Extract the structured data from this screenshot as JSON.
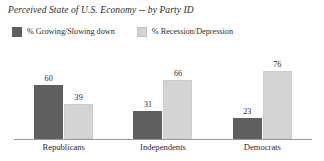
{
  "chart_data": {
    "type": "bar",
    "title": "Perceived State of U.S. Economy -- by Party ID",
    "xlabel": "",
    "ylabel": "",
    "ylim": [
      0,
      80
    ],
    "grid": false,
    "legend_position": "top-left",
    "categories": [
      "Republicans",
      "Independents",
      "Democrats"
    ],
    "series": [
      {
        "name": "% Growing/Slowing down",
        "color": "#5f5f5f",
        "values": [
          60,
          39,
          31
        ]
      },
      {
        "name": "% Recession/Depression",
        "color": "#d4d4d4",
        "values": [
          39,
          66,
          76
        ]
      }
    ],
    "groups": [
      {
        "category": "Republicans",
        "bars": [
          {
            "series": "% Growing/Slowing down",
            "value": 60,
            "label": "60",
            "color": "#5f5f5f"
          },
          {
            "series": "% Recession/Depression",
            "value": 39,
            "label": "39",
            "color": "#d4d4d4"
          }
        ]
      },
      {
        "category": "Independents",
        "bars": [
          {
            "series": "% Growing/Slowing down",
            "value": 31,
            "label": "31",
            "color": "#5f5f5f"
          },
          {
            "series": "% Recession/Depression",
            "value": 66,
            "label": "66",
            "color": "#d4d4d4"
          }
        ]
      },
      {
        "category": "Democrats",
        "bars": [
          {
            "series": "% Growing/Slowing down",
            "value": 23,
            "label": "23",
            "color": "#5f5f5f"
          },
          {
            "series": "% Recession/Depression",
            "value": 76,
            "label": "76",
            "color": "#d4d4d4"
          }
        ]
      }
    ]
  },
  "chart": {
    "title": "Perceived State of U.S. Economy -- by Party ID",
    "legend": [
      {
        "label": "% Growing/Slowing down",
        "color": "#5f5f5f"
      },
      {
        "label": "% Recession/Depression",
        "color": "#d4d4d4"
      }
    ],
    "axis_color": "#9a9a9a",
    "text_color": "#2b2b2b",
    "background": "#ffffff"
  }
}
